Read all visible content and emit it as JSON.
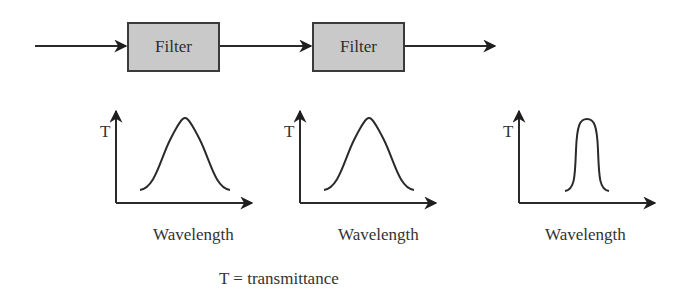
{
  "pipeline": {
    "filters": [
      {
        "label": "Filter"
      },
      {
        "label": "Filter"
      }
    ],
    "fill_color": "#c9c9c9",
    "stroke_color": "#2a2a2a"
  },
  "plots": [
    {
      "y_label": "T",
      "x_label": "Wavelength",
      "curve": "broad-bell"
    },
    {
      "y_label": "T",
      "x_label": "Wavelength",
      "curve": "broad-bell"
    },
    {
      "y_label": "T",
      "x_label": "Wavelength",
      "curve": "narrow-bell"
    }
  ],
  "legend": {
    "text": "T = transmittance"
  }
}
